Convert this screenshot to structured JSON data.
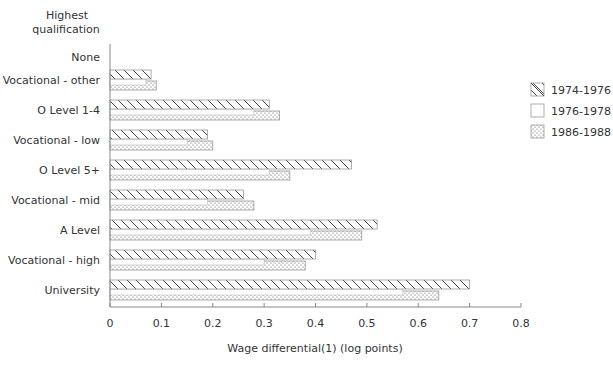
{
  "chart_data": {
    "type": "bar",
    "orientation": "horizontal",
    "title": "",
    "ylabel": "Highest qualification",
    "xlabel": "Wage differential(1) (log points)",
    "xlim": [
      0,
      0.8
    ],
    "xticks": [
      0,
      0.1,
      0.2,
      0.3,
      0.4,
      0.5,
      0.6,
      0.7,
      0.8
    ],
    "xtick_labels": [
      "0",
      "0.1",
      "0.2",
      "0.3",
      "0.4",
      "0.5",
      "0.6",
      "0.7",
      "0.8"
    ],
    "grid": false,
    "legend_position": "right",
    "categories": [
      "None",
      "Vocational - other",
      "O Level 1-4",
      "Vocational - low",
      "O Level 5+",
      "Vocational - mid",
      "A Level",
      "Vocational - high",
      "University"
    ],
    "series": [
      {
        "name": "1974-1976",
        "pattern": "hatched",
        "values": [
          0,
          0.08,
          0.31,
          0.19,
          0.47,
          0.26,
          0.52,
          0.4,
          0.7
        ]
      },
      {
        "name": "1976-1978",
        "pattern": "plain",
        "values": [
          0,
          0.07,
          0.28,
          0.15,
          0.31,
          0.19,
          0.39,
          0.3,
          0.57
        ]
      },
      {
        "name": "1986-1988",
        "pattern": "dotted",
        "values": [
          0,
          0.09,
          0.33,
          0.2,
          0.35,
          0.28,
          0.49,
          0.38,
          0.64
        ]
      }
    ]
  },
  "labels": {
    "yaxis_title_line1": "Highest",
    "yaxis_title_line2": "qualification",
    "xaxis_title": "Wage differential(1) (log points)"
  },
  "legend": [
    {
      "label": "1974-1976",
      "pattern": "hatched"
    },
    {
      "label": "1976-1978",
      "pattern": "plain"
    },
    {
      "label": "1986-1988",
      "pattern": "dotted"
    }
  ]
}
